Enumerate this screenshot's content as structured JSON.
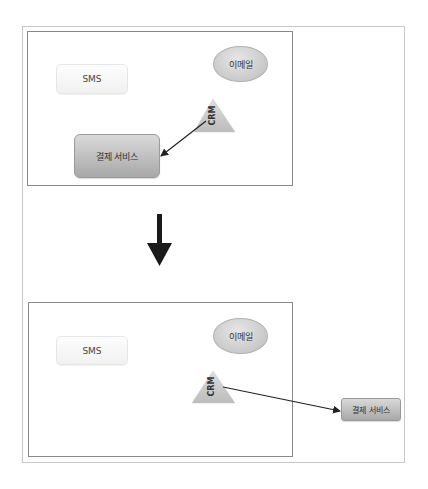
{
  "diagram": {
    "before": {
      "sms_label": "SMS",
      "email_label": "이메일",
      "crm_label": "CRM",
      "payment_label": "결제 서비스"
    },
    "transition_arrow": "down-arrow",
    "after": {
      "sms_label": "SMS",
      "email_label": "이메일",
      "crm_label": "CRM",
      "payment_label": "결제 서비스"
    },
    "colors": {
      "frame": "#c8c8c8",
      "panel_border": "#8a8a8a",
      "node_fill_light": "#f1f1f1",
      "node_fill_dark": "#a8a8a8",
      "arrow": "#222222"
    }
  }
}
